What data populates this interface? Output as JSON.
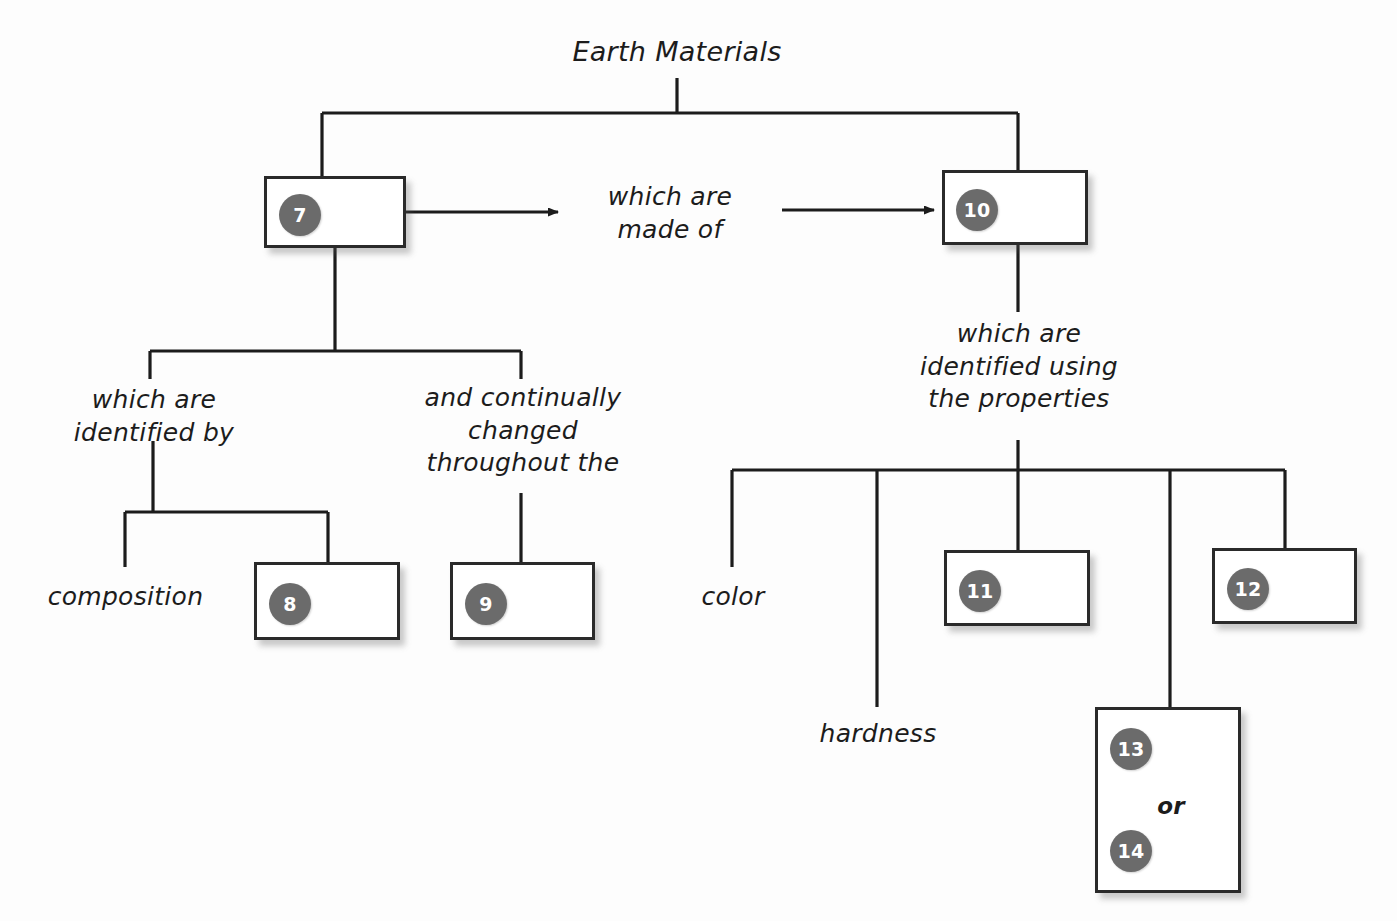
{
  "diagram": {
    "title": "Earth Materials",
    "nodes": {
      "n7": {
        "badge": "7"
      },
      "n8": {
        "badge": "8"
      },
      "n9": {
        "badge": "9"
      },
      "n10": {
        "badge": "10"
      },
      "n11": {
        "badge": "11"
      },
      "n12": {
        "badge": "12"
      },
      "n13": {
        "badge": "13"
      },
      "n14": {
        "badge": "14"
      },
      "n13_14_connector": {
        "text": "or"
      }
    },
    "connector_labels": {
      "which_are_made_of": "which are\nmade of",
      "which_are_identified_by": "which are\nidentified by",
      "and_continually_changed": "and continually\nchanged\nthroughout the",
      "which_are_identified_using": "which are\nidentified using\nthe properties"
    },
    "leaf_labels": {
      "composition": "composition",
      "color": "color",
      "hardness": "hardness"
    },
    "colors": {
      "badge_fill": "#6b6b6b",
      "badge_text": "#ffffff",
      "box_border": "#2a2a2a",
      "box_fill": "#ffffff",
      "line": "#1c1c1c",
      "text": "#1c1c1c",
      "background": "#fdfdfd"
    }
  }
}
